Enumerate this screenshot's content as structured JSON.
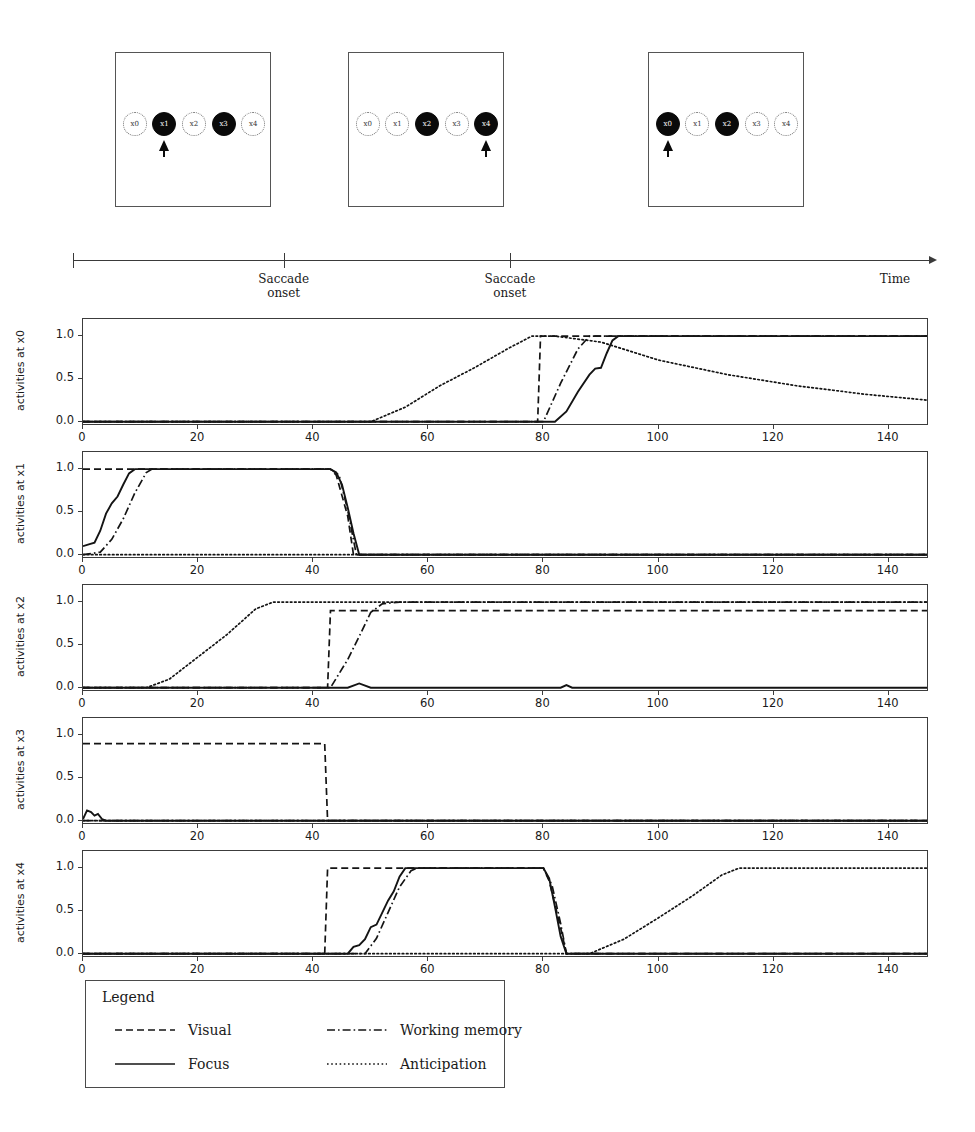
{
  "stimulus_panels": [
    {
      "id": "panel-1",
      "nodes": [
        {
          "label": "x0",
          "filled": false,
          "arrow": false
        },
        {
          "label": "x1",
          "filled": true,
          "arrow": true
        },
        {
          "label": "x2",
          "filled": false,
          "arrow": false
        },
        {
          "label": "x3",
          "filled": true,
          "arrow": false
        },
        {
          "label": "x4",
          "filled": false,
          "arrow": false
        }
      ]
    },
    {
      "id": "panel-2",
      "nodes": [
        {
          "label": "x0",
          "filled": false,
          "arrow": false
        },
        {
          "label": "x1",
          "filled": false,
          "arrow": false
        },
        {
          "label": "x2",
          "filled": true,
          "arrow": false
        },
        {
          "label": "x3",
          "filled": false,
          "arrow": false
        },
        {
          "label": "x4",
          "filled": true,
          "arrow": true
        }
      ]
    },
    {
      "id": "panel-3",
      "nodes": [
        {
          "label": "x0",
          "filled": true,
          "arrow": true
        },
        {
          "label": "x1",
          "filled": false,
          "arrow": false
        },
        {
          "label": "x2",
          "filled": true,
          "arrow": false
        },
        {
          "label": "x3",
          "filled": false,
          "arrow": false
        },
        {
          "label": "x4",
          "filled": false,
          "arrow": false
        }
      ]
    }
  ],
  "timeline": {
    "end_label": "Time",
    "events": [
      {
        "label": "Saccade\nonset",
        "x_frac": 0.245
      },
      {
        "label": "Saccade\nonset",
        "x_frac": 0.508
      }
    ]
  },
  "legend": {
    "title": "Legend",
    "entries": [
      {
        "label": "Visual",
        "style": "dashed"
      },
      {
        "label": "Working memory",
        "style": "dashdot"
      },
      {
        "label": "Focus",
        "style": "solid"
      },
      {
        "label": "Anticipation",
        "style": "dotted"
      }
    ]
  },
  "chart_data": {
    "type": "line",
    "xlabel": "",
    "ylabel": "activities",
    "xlim": [
      0,
      147
    ],
    "ylim": [
      -0.05,
      1.2
    ],
    "xticks": [
      0,
      20,
      40,
      60,
      80,
      100,
      120,
      140
    ],
    "yticks": [
      0.0,
      0.5,
      1.0
    ],
    "ytick_labels": [
      "0.0",
      "0.5",
      "1.0"
    ],
    "grid": false,
    "legend_position": "below",
    "series_styles": {
      "Visual": "dashed",
      "Working memory": "dashdot",
      "Focus": "solid",
      "Anticipation": "dotted"
    },
    "panels": [
      {
        "ylabel": "activities at x0",
        "series": [
          {
            "name": "Visual",
            "style": "dashed",
            "points": [
              [
                0,
                0
              ],
              [
                79,
                0
              ],
              [
                79.5,
                1.0
              ],
              [
                147,
                1.0
              ]
            ]
          },
          {
            "name": "Working memory",
            "style": "dashdot",
            "points": [
              [
                0,
                0
              ],
              [
                80,
                0
              ],
              [
                83,
                0.45
              ],
              [
                86,
                0.85
              ],
              [
                88,
                1.0
              ],
              [
                147,
                1.0
              ]
            ]
          },
          {
            "name": "Focus",
            "style": "solid",
            "points": [
              [
                0,
                0
              ],
              [
                82,
                0
              ],
              [
                84,
                0.12
              ],
              [
                86,
                0.35
              ],
              [
                88,
                0.55
              ],
              [
                89,
                0.62
              ],
              [
                90,
                0.63
              ],
              [
                91,
                0.8
              ],
              [
                92,
                0.95
              ],
              [
                93,
                1.0
              ],
              [
                147,
                1.0
              ]
            ]
          },
          {
            "name": "Anticipation",
            "style": "dotted",
            "points": [
              [
                0,
                0
              ],
              [
                50,
                0
              ],
              [
                56,
                0.17
              ],
              [
                62,
                0.42
              ],
              [
                68,
                0.63
              ],
              [
                74,
                0.86
              ],
              [
                78,
                1.0
              ],
              [
                82,
                1.0
              ],
              [
                90,
                0.93
              ],
              [
                100,
                0.72
              ],
              [
                112,
                0.55
              ],
              [
                124,
                0.42
              ],
              [
                136,
                0.32
              ],
              [
                147,
                0.25
              ]
            ]
          }
        ]
      },
      {
        "ylabel": "activities at x1",
        "series": [
          {
            "name": "Visual",
            "style": "dashed",
            "points": [
              [
                0,
                1.0
              ],
              [
                43,
                1.0
              ],
              [
                44,
                0.93
              ],
              [
                46,
                0.45
              ],
              [
                47,
                0.0
              ],
              [
                147,
                0.0
              ]
            ]
          },
          {
            "name": "Working memory",
            "style": "dashdot",
            "points": [
              [
                0,
                0.0
              ],
              [
                3,
                0.03
              ],
              [
                5,
                0.18
              ],
              [
                7,
                0.42
              ],
              [
                9,
                0.72
              ],
              [
                11,
                0.96
              ],
              [
                12,
                1.0
              ],
              [
                43,
                1.0
              ],
              [
                44.5,
                0.93
              ],
              [
                46,
                0.52
              ],
              [
                47.5,
                0.0
              ],
              [
                147,
                0.0
              ]
            ]
          },
          {
            "name": "Focus",
            "style": "solid",
            "points": [
              [
                0,
                0.1
              ],
              [
                1,
                0.12
              ],
              [
                2,
                0.14
              ],
              [
                3,
                0.28
              ],
              [
                4,
                0.48
              ],
              [
                5,
                0.6
              ],
              [
                6,
                0.68
              ],
              [
                7,
                0.82
              ],
              [
                8,
                0.95
              ],
              [
                9,
                1.0
              ],
              [
                43,
                1.0
              ],
              [
                44,
                0.96
              ],
              [
                45,
                0.82
              ],
              [
                46,
                0.55
              ],
              [
                47,
                0.25
              ],
              [
                48,
                0.0
              ],
              [
                147,
                0.0
              ]
            ]
          },
          {
            "name": "Anticipation",
            "style": "dotted",
            "points": [
              [
                0,
                0.0
              ],
              [
                147,
                0.0
              ]
            ]
          }
        ]
      },
      {
        "ylabel": "activities at x2",
        "series": [
          {
            "name": "Visual",
            "style": "dashed",
            "points": [
              [
                0,
                0.0
              ],
              [
                42.5,
                0.0
              ],
              [
                43,
                0.9
              ],
              [
                147,
                0.9
              ]
            ]
          },
          {
            "name": "Working memory",
            "style": "dashdot",
            "points": [
              [
                0,
                0.0
              ],
              [
                43,
                0.0
              ],
              [
                46,
                0.33
              ],
              [
                48,
                0.6
              ],
              [
                50,
                0.88
              ],
              [
                52,
                0.98
              ],
              [
                55,
                1.0
              ],
              [
                147,
                1.0
              ]
            ]
          },
          {
            "name": "Focus",
            "style": "solid",
            "points": [
              [
                0,
                0.0
              ],
              [
                46,
                0.0
              ],
              [
                48,
                0.05
              ],
              [
                50,
                0.0
              ],
              [
                83,
                0.0
              ],
              [
                84,
                0.03
              ],
              [
                85,
                0.0
              ],
              [
                147,
                0.0
              ]
            ]
          },
          {
            "name": "Anticipation",
            "style": "dotted",
            "points": [
              [
                0,
                0.0
              ],
              [
                11,
                0.0
              ],
              [
                15,
                0.1
              ],
              [
                20,
                0.36
              ],
              [
                25,
                0.62
              ],
              [
                30,
                0.92
              ],
              [
                33,
                1.0
              ],
              [
                147,
                1.0
              ]
            ]
          }
        ]
      },
      {
        "ylabel": "activities at x3",
        "series": [
          {
            "name": "Visual",
            "style": "dashed",
            "points": [
              [
                0,
                0.9
              ],
              [
                42,
                0.9
              ],
              [
                42.5,
                0.0
              ],
              [
                147,
                0.0
              ]
            ]
          },
          {
            "name": "Working memory",
            "style": "dashdot",
            "points": [
              [
                0,
                0.0
              ],
              [
                147,
                0.0
              ]
            ]
          },
          {
            "name": "Focus",
            "style": "solid",
            "points": [
              [
                0,
                0.02
              ],
              [
                0.7,
                0.12
              ],
              [
                1.4,
                0.1
              ],
              [
                2,
                0.06
              ],
              [
                2.6,
                0.08
              ],
              [
                3.3,
                0.02
              ],
              [
                4,
                0.0
              ],
              [
                147,
                0.0
              ]
            ]
          },
          {
            "name": "Anticipation",
            "style": "dotted",
            "points": [
              [
                0,
                0.0
              ],
              [
                147,
                0.0
              ]
            ]
          }
        ]
      },
      {
        "ylabel": "activities at x4",
        "series": [
          {
            "name": "Visual",
            "style": "dashed",
            "points": [
              [
                0,
                0.0
              ],
              [
                42,
                0.0
              ],
              [
                42.5,
                1.0
              ],
              [
                80,
                1.0
              ],
              [
                81,
                0.85
              ],
              [
                83,
                0.3
              ],
              [
                84,
                0.0
              ],
              [
                147,
                0.0
              ]
            ]
          },
          {
            "name": "Working memory",
            "style": "dashdot",
            "points": [
              [
                0,
                0.0
              ],
              [
                49,
                0.0
              ],
              [
                51,
                0.18
              ],
              [
                53,
                0.48
              ],
              [
                55,
                0.78
              ],
              [
                57,
                0.97
              ],
              [
                58,
                1.0
              ],
              [
                80,
                1.0
              ],
              [
                81.5,
                0.8
              ],
              [
                83,
                0.35
              ],
              [
                84,
                0.0
              ],
              [
                147,
                0.0
              ]
            ]
          },
          {
            "name": "Focus",
            "style": "solid",
            "points": [
              [
                0,
                0.0
              ],
              [
                46,
                0.0
              ],
              [
                47,
                0.08
              ],
              [
                48,
                0.1
              ],
              [
                49,
                0.17
              ],
              [
                50,
                0.31
              ],
              [
                51,
                0.34
              ],
              [
                52,
                0.48
              ],
              [
                53,
                0.62
              ],
              [
                54,
                0.73
              ],
              [
                55,
                0.9
              ],
              [
                56,
                1.0
              ],
              [
                80,
                1.0
              ],
              [
                81,
                0.88
              ],
              [
                82,
                0.55
              ],
              [
                83,
                0.2
              ],
              [
                84,
                0.0
              ],
              [
                147,
                0.0
              ]
            ]
          },
          {
            "name": "Anticipation",
            "style": "dotted",
            "points": [
              [
                0,
                0.0
              ],
              [
                88,
                0.0
              ],
              [
                94,
                0.17
              ],
              [
                100,
                0.42
              ],
              [
                106,
                0.68
              ],
              [
                111,
                0.92
              ],
              [
                114,
                1.0
              ],
              [
                147,
                1.0
              ]
            ]
          }
        ]
      }
    ]
  }
}
